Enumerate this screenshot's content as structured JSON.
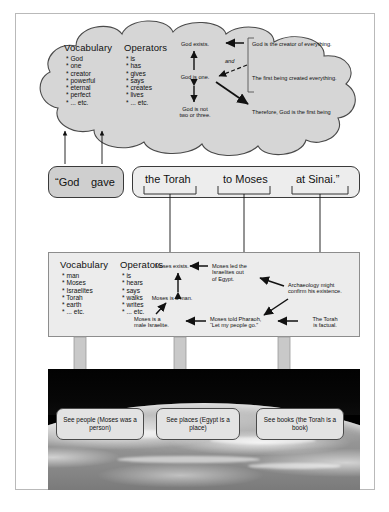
{
  "diagram": {
    "cloud": {
      "vocabulary_header": "Vocabulary",
      "vocabulary_items": [
        "* God",
        "* one",
        "* creator",
        "* powerful",
        "* eternal",
        "* perfect",
        "* ... etc."
      ],
      "operators_header": "Operators",
      "operators_items": [
        "* is",
        "* has",
        "* gives",
        "* says",
        "* creates",
        "* lives",
        "* ... etc."
      ],
      "props": {
        "exists": "God exists.",
        "one": "God is one.",
        "not_two": "God is not\ntwo or three.",
        "creator": "God is the creator of everything.",
        "first_created": "The first being created everything.",
        "therefore": "Therefore, God is the first being",
        "and_label": "and"
      }
    },
    "sentence": {
      "left_box": {
        "words": [
          "“God",
          "gave"
        ]
      },
      "right_box": {
        "phrases": [
          "the Torah",
          "to Moses",
          "at Sinai.”"
        ]
      }
    },
    "middle": {
      "vocabulary_header": "Vocabulary",
      "vocabulary_items": [
        "* man",
        "* Moses",
        "* Israelites",
        "* Torah",
        "* earth",
        "* ... etc."
      ],
      "operators_header": "Operators",
      "operators_items": [
        "* is",
        "* hears",
        "* says",
        "* walks",
        "* writes",
        "* ... etc."
      ],
      "props": {
        "exists": "Moses exists.",
        "is_a_man": "Moses is a man.",
        "male_israelite": "Moses is a\nmale Israelite.",
        "led_out": "Moses led the\nIsraelites out\nof Egypt.",
        "told_pharaoh": "Moses told Pharaoh,\n“Let my people go.”",
        "archaeology": "Archaeology might\nconfirm his existence.",
        "torah_factual": "The Torah\nis factual."
      }
    },
    "outcomes": [
      "See people (Moses was a person)",
      "See places (Egypt is a place)",
      "See books (the Torah is a book)"
    ]
  },
  "colors": {
    "cloud_fill": "#d6d6d6",
    "cloud_stroke": "#4a4a4a",
    "sentence_dark": "#cfcfcf",
    "sentence_light": "#ededed",
    "rect_fill": "#ececec",
    "block_arrow": "#c9c9c9",
    "frame": "#b9b9b9"
  }
}
